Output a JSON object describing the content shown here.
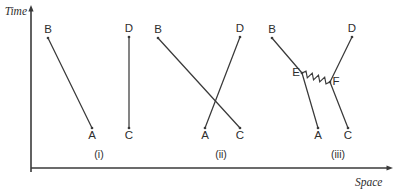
{
  "figure": {
    "name": "spacetime-worldline-diagrams",
    "background_color": "#ffffff",
    "ink_color": "#3a3a3a",
    "width": 405,
    "height": 190
  },
  "axes": {
    "time": {
      "label": "Time",
      "orientation": "vertical",
      "arrow": "up",
      "x": 31,
      "y_top": 5,
      "y_bottom": 172,
      "label_x": 27,
      "label_y": 15
    },
    "space": {
      "label": "Space",
      "orientation": "horizontal",
      "arrow": "right",
      "y": 168,
      "x_left": 31,
      "x_right": 393,
      "label_x": 355,
      "label_y": 186
    }
  },
  "panels": [
    {
      "id": "i",
      "caption": "(i)",
      "caption_x": 99,
      "caption_y": 158,
      "points": [
        {
          "label": "A",
          "x": 92,
          "y": 128,
          "label_x": 92,
          "label_y": 139
        },
        {
          "label": "B",
          "x": 48,
          "y": 38,
          "label_x": 48,
          "label_y": 33
        },
        {
          "label": "C",
          "x": 129,
          "y": 128,
          "label_x": 129,
          "label_y": 139
        },
        {
          "label": "D",
          "x": 129,
          "y": 37,
          "label_x": 129,
          "label_y": 32
        }
      ],
      "segments": [
        {
          "kind": "straight",
          "from": "B",
          "to": "A"
        },
        {
          "kind": "straight",
          "from": "D",
          "to": "C"
        }
      ]
    },
    {
      "id": "ii",
      "caption": "(ii)",
      "caption_x": 221,
      "caption_y": 158,
      "points": [
        {
          "label": "A",
          "x": 205,
          "y": 128,
          "label_x": 205,
          "label_y": 139
        },
        {
          "label": "B",
          "x": 158,
          "y": 38,
          "label_x": 158,
          "label_y": 33
        },
        {
          "label": "C",
          "x": 240,
          "y": 128,
          "label_x": 240,
          "label_y": 139
        },
        {
          "label": "D",
          "x": 240,
          "y": 37,
          "label_x": 240,
          "label_y": 32
        }
      ],
      "segments": [
        {
          "kind": "straight",
          "from": "B",
          "to": "C"
        },
        {
          "kind": "straight",
          "from": "D",
          "to": "A"
        }
      ]
    },
    {
      "id": "iii",
      "caption": "(iii)",
      "caption_x": 338,
      "caption_y": 158,
      "points": [
        {
          "label": "A",
          "x": 318,
          "y": 128,
          "label_x": 318,
          "label_y": 139
        },
        {
          "label": "B",
          "x": 272,
          "y": 38,
          "label_x": 272,
          "label_y": 33
        },
        {
          "label": "C",
          "x": 348,
          "y": 128,
          "label_x": 348,
          "label_y": 139
        },
        {
          "label": "D",
          "x": 352,
          "y": 37,
          "label_x": 352,
          "label_y": 32
        },
        {
          "label": "E",
          "x": 302,
          "y": 73,
          "label_x": 296,
          "label_y": 76
        },
        {
          "label": "F",
          "x": 330,
          "y": 82,
          "label_x": 336,
          "label_y": 85
        }
      ],
      "segments": [
        {
          "kind": "straight",
          "from": "B",
          "to": "E"
        },
        {
          "kind": "straight",
          "from": "E",
          "to": "A"
        },
        {
          "kind": "straight",
          "from": "D",
          "to": "F"
        },
        {
          "kind": "straight",
          "from": "F",
          "to": "C"
        },
        {
          "kind": "zigzag",
          "from": "E",
          "to": "F",
          "peaks": 8,
          "amplitude": 3
        }
      ]
    }
  ]
}
